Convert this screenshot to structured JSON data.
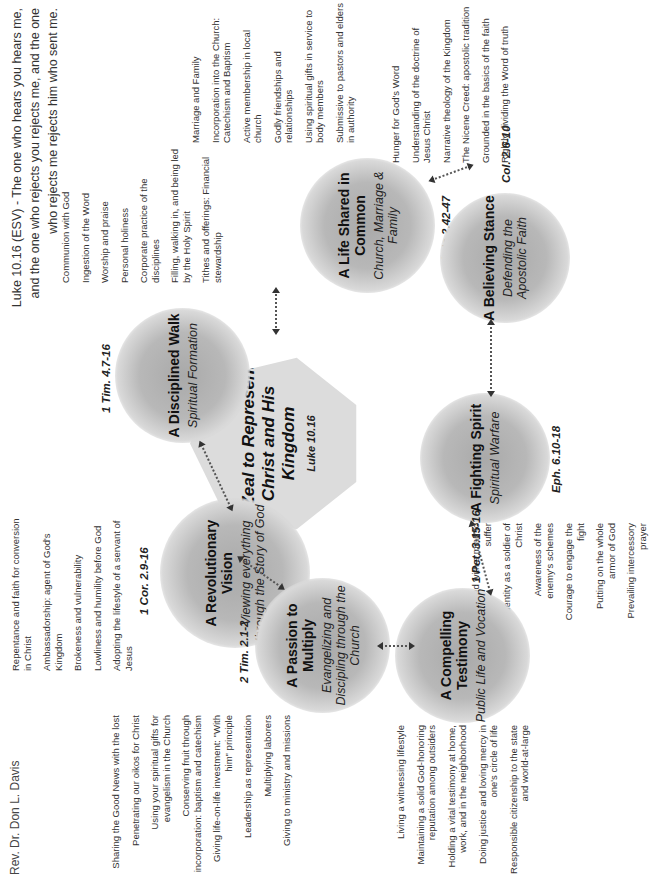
{
  "credit": "Rev. Dr. Don L. Davis",
  "quote": "Luke 10.16 (ESV) - The one who hears you hears me, and the one who rejects you rejects me, and the one who rejects me rejects him who sent me.",
  "hub": {
    "title": "A Zeal to Represent Christ and His Kingdom",
    "ref": "Luke 10.16"
  },
  "nodes": [
    {
      "title": "A Revolutionary Vision",
      "subtitle": "Viewing everything through the Story of God",
      "ref": "1 Cor. 2.9-16",
      "items": [
        "Repentance and faith for conversion in Christ",
        "Ambassadorship: agent of God's Kingdom",
        "Brokeness and vulnerability",
        "Lowliness and humility before God",
        "Adopting the lifestyle of a servant of Jesus"
      ]
    },
    {
      "title": "A Disciplined Walk",
      "subtitle": "Spiritual Formation",
      "ref": "1 Tim. 4.7-16",
      "items": [
        "Communion with God",
        "Ingestion of the Word",
        "Worship and praise",
        "Personal holiness",
        "Corporate practice of the disciplines",
        "Filling, walking in, and being led by the Holy Spirit",
        "Tithes and offerings: Financial stewardship"
      ]
    },
    {
      "title": "A Life Shared in Common",
      "subtitle": "Church, Marriage & Family",
      "ref": "Acts 2.42-47",
      "items": [
        "Marriage and Family",
        "Incorporation into the Church: Catechism and Baptism",
        "Active membership in local church",
        "Godly friendships and relationships",
        "Using spiritual gifts in service to body members",
        "Submissive to pastors and elders in authority"
      ]
    },
    {
      "title": "A Believing Stance",
      "subtitle": "Defending the Apostolic Faith",
      "ref": "Col. 2.6-10",
      "items": [
        "Hunger for God's Word",
        "Understanding of the doctrine of Jesus Christ",
        "Narrative theology of the Kingdom",
        "The Nicene Creed: apostolic tradition",
        "Grounded in the basics of the faith",
        "Rightly dividing the Word of truth"
      ]
    },
    {
      "title": "A Fighting Spirit",
      "subtitle": "Spiritual Warfare",
      "ref": "Eph. 6.10-18",
      "items": [
        "Armed with a mind to suffer",
        "Identity as a soldier of Christ",
        "Awareness of the enemy's schemes",
        "Courage to engage the fight",
        "Putting on the whole armor of God",
        "Prevailing intercessory prayer"
      ]
    },
    {
      "title": "A Compelling Testimony",
      "subtitle": "Public Life and Vocation",
      "ref": "1 Pet. 3.15-16",
      "items": [
        "Living a witnessing lifestyle",
        "Maintaining a solid God-honoring reputation among outsiders",
        "Holding a vital testimony at home, work, and in the neighborhood",
        "Doing justice and loving mercy in one's circle of life",
        "Responsible citizenship to the state and world-at-large"
      ]
    },
    {
      "title": "A Passion to Multiply",
      "subtitle": "Evangelizing and Discipling through the Church",
      "ref": "2 Tim. 2.1-2",
      "items": [
        "Sharing the Good News with the lost",
        "Penetrating our oikos for Christ",
        "Using your spiritual gifts for evangelism in the Church",
        "Conserving fruit through incorporation: baptism and catechism",
        "Giving life-on-life investment: \"With him\" principle",
        "Leadership as representation",
        "Multiplying laborers",
        "Giving to ministry and missions"
      ]
    }
  ]
}
